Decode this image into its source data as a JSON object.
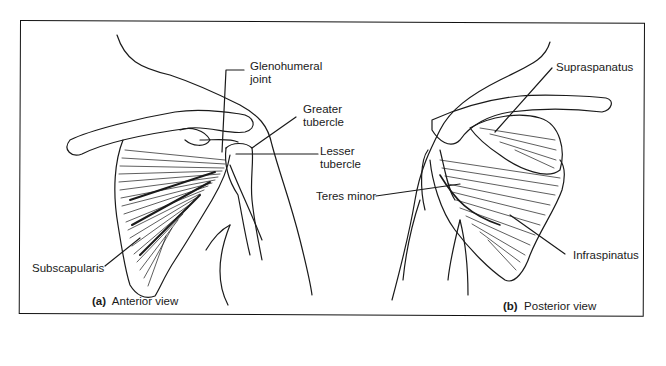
{
  "figure": {
    "panels": [
      {
        "id": "a",
        "letter": "(a)",
        "caption": "Anterior view",
        "labels": {
          "glenohumeral_joint_line1": "Glenohumeral",
          "glenohumeral_joint_line2": "joint",
          "greater_tubercle_line1": "Greater",
          "greater_tubercle_line2": "tubercle",
          "lesser_tubercle_line1": "Lesser",
          "lesser_tubercle_line2": "tubercle",
          "subscapularis": "Subscapularis"
        }
      },
      {
        "id": "b",
        "letter": "(b)",
        "caption": "Posterior view",
        "labels": {
          "supraspinatus": "Supraspanatus",
          "teres_minor": "Teres minor",
          "infraspinatus": "Infraspinatus"
        }
      }
    ]
  },
  "colors": {
    "ink": "#1a1a1a",
    "background": "#ffffff",
    "border": "#111111"
  }
}
